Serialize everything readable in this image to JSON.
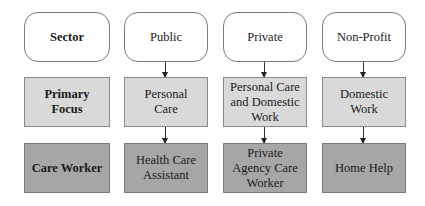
{
  "row_labels": {
    "sector": "Sector",
    "primary_focus": "Primary Focus",
    "care_worker": "Care Worker"
  },
  "columns": [
    {
      "sector": "Public",
      "primary_focus": "Personal Care",
      "care_worker": "Health Care Assistant"
    },
    {
      "sector": "Private",
      "primary_focus": "Personal Care and Domestic Work",
      "care_worker": "Private Agency Care Worker"
    },
    {
      "sector": "Non-Profit",
      "primary_focus": "Domestic Work",
      "care_worker": "Home Help"
    }
  ],
  "colors": {
    "header_fill": "#ffffff",
    "focus_fill": "#d9d9d9",
    "worker_fill": "#a6a6a6",
    "border": "#7a7a7a"
  }
}
